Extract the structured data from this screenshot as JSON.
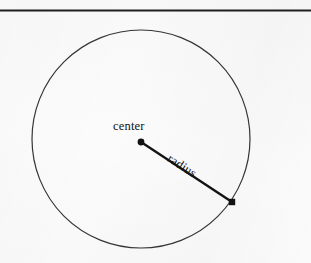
{
  "figure": {
    "kind": "geometry-diagram",
    "background_color": "#fbfbfb",
    "ink_color": "#1a1a1a",
    "rule": {
      "name": "top-horizontal-rule",
      "x1": 0,
      "y1": 10,
      "x2": 311,
      "y2": 10,
      "thickness": 2,
      "color": "#1f1f1f"
    },
    "circle": {
      "cx": 141,
      "cy": 139,
      "r": 109,
      "stroke_color": "#343434",
      "stroke_width": 1.2,
      "fill": "none"
    },
    "radius_segment": {
      "x1": 141,
      "y1": 142,
      "x2": 232,
      "y2": 202,
      "stroke_color": "#141414",
      "stroke_width": 2.4,
      "angle_degrees": 33
    },
    "center_point": {
      "cx": 141,
      "cy": 142,
      "r": 3.4,
      "color": "#121212",
      "shape": "dot"
    },
    "edge_point": {
      "cx": 232,
      "cy": 202,
      "size": 6.4,
      "color": "#121212",
      "shape": "square"
    },
    "labels": {
      "center": "center",
      "radius": "radius"
    }
  }
}
